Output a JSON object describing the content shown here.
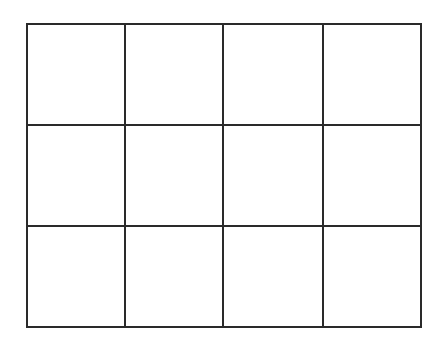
{
  "grid": {
    "columns": 4,
    "rows": 3,
    "col_edges": [
      27,
      125,
      223,
      323,
      421
    ],
    "row_edges": [
      24,
      125,
      226,
      327
    ],
    "line_color": "#2a2a2a",
    "background": "#ffffff",
    "line_width": 2
  }
}
